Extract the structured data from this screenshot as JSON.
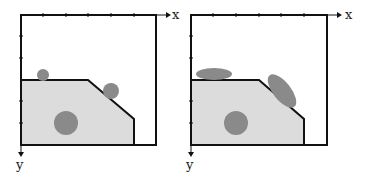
{
  "colors": {
    "frame": "#111111",
    "region_fill": "#dcdcdc",
    "blob_fill": "#8a8a8a",
    "background": "#ffffff"
  },
  "panels": [
    {
      "id": "left",
      "x_axis_label": "x",
      "y_axis_label": "y",
      "blobs": [
        {
          "shape": "circle",
          "cx": 43,
          "cy": 75,
          "r": 6
        },
        {
          "shape": "circle",
          "cx": 111,
          "cy": 91,
          "r": 8
        },
        {
          "shape": "circle",
          "cx": 66,
          "cy": 123,
          "r": 12
        }
      ]
    },
    {
      "id": "right",
      "x_axis_label": "x",
      "y_axis_label": "y",
      "blobs": [
        {
          "shape": "ellipse",
          "cx": 214,
          "cy": 75,
          "rx": 18,
          "ry": 6,
          "rotate": 0
        },
        {
          "shape": "ellipse",
          "cx": 282,
          "cy": 91,
          "rx": 20,
          "ry": 9,
          "rotate": 52
        },
        {
          "shape": "circle",
          "cx": 236,
          "cy": 123,
          "r": 12
        }
      ]
    }
  ]
}
